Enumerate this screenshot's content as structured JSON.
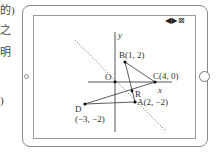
{
  "margin_text": [
    {
      "text": "的)",
      "top": 5
    },
    {
      "text": "之",
      "top": 25
    },
    {
      "text": "明",
      "top": 47
    },
    {
      "text": ")",
      "top": 95
    }
  ],
  "device": {
    "controls": {
      "prev_icon": "◀",
      "next_icon": "▶",
      "close_icon": "⊠"
    }
  },
  "graph": {
    "axis_x_label": "x",
    "axis_y_label": "y",
    "origin_label": "O",
    "points": [
      {
        "name": "B",
        "label": "B(1, 2)",
        "x": 1,
        "y": 2
      },
      {
        "name": "C",
        "label": "C(4, 0)",
        "x": 4,
        "y": 0
      },
      {
        "name": "A",
        "label": "A(2, −2)",
        "x": 2,
        "y": -2
      },
      {
        "name": "D",
        "label": "D",
        "coord_label": "(−3, −2)",
        "x": -3,
        "y": -2
      }
    ],
    "intersection_label": "R"
  }
}
